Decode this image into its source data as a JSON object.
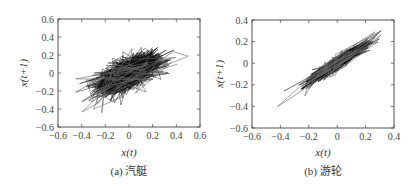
{
  "chart_data": [
    {
      "type": "line",
      "subtype": "phase-space trajectory (return map)",
      "title": "",
      "caption": "(a) 汽艇",
      "xlabel": "x(t)",
      "ylabel": "x(t+1)",
      "xlim": [
        -0.6,
        0.6
      ],
      "ylim": [
        -0.6,
        0.6
      ],
      "xticks": [
        "-0.6",
        "-0.4",
        "-0.2",
        "0",
        "0.2",
        "0.4",
        "0.6"
      ],
      "yticks": [
        "0.6",
        "0.4",
        "0.2",
        "0",
        "-0.2",
        "-0.4",
        "-0.6"
      ],
      "grid": false,
      "legend": null,
      "description": "Dense black cloud centered near origin, elongated along positive diagonal, core spanning x≈-0.3..0.3, y≈-0.3..0.25; outlier polygon lines reach x≈-0.45..0.5, y≈-0.5..0.5",
      "extent": {
        "x_min": -0.45,
        "x_max": 0.5,
        "y_min": -0.5,
        "y_max": 0.5
      },
      "core": {
        "cx": 0.0,
        "cy": 0.0,
        "sx": 0.12,
        "sy": 0.1,
        "corr": 0.6
      }
    },
    {
      "type": "line",
      "subtype": "phase-space trajectory (return map)",
      "title": "",
      "caption": "(b) 游轮",
      "xlabel": "x(t)",
      "ylabel": "x(t+1)",
      "xlim": [
        -0.6,
        0.4
      ],
      "ylim": [
        -0.6,
        0.4
      ],
      "xticks": [
        "-0.6",
        "-0.4",
        "-0.2",
        "0",
        "0.2",
        "0.4"
      ],
      "yticks": [
        "0.4",
        "0.2",
        "0",
        "-0.2",
        "-0.4",
        "-0.6"
      ],
      "grid": false,
      "legend": null,
      "description": "Narrow elongated black cloud along positive diagonal from about (-0.22,-0.22) to (0.25,0.25); outer loops extend to (-0.42,-0.4) and (0.3,0.3)",
      "extent": {
        "x_min": -0.42,
        "x_max": 0.31,
        "y_min": -0.42,
        "y_max": 0.3
      },
      "core": {
        "cx": 0.0,
        "cy": 0.0,
        "sx": 0.09,
        "sy": 0.08,
        "corr": 0.95
      }
    }
  ],
  "captions": {
    "a": "(a) 汽艇",
    "b": "(b) 游轮"
  },
  "labels": {
    "x": "x(t)",
    "y": "x(t+1)"
  }
}
